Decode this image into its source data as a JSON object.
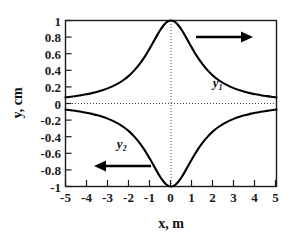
{
  "chart_data": {
    "type": "line",
    "title": "",
    "xlabel": "x,  m",
    "ylabel": "y,  cm",
    "xlim": [
      -5,
      5
    ],
    "ylim": [
      -1,
      1
    ],
    "grid": false,
    "legend_position": "inline-annotation",
    "xticks": [
      "-5",
      "-4",
      "-3",
      "-2",
      "-1",
      "0",
      "1",
      "2",
      "3",
      "4",
      "5"
    ],
    "xtick_values": [
      -5,
      -4,
      -3,
      -2,
      -1,
      0,
      1,
      2,
      3,
      4,
      5
    ],
    "yticks": [
      "1",
      "0.8",
      "0.6",
      "0.4",
      "0.2",
      "0",
      "-0.2",
      "-0.4",
      "-0.6",
      "-0.8",
      "-1"
    ],
    "ytick_values": [
      1,
      0.8,
      0.6,
      0.4,
      0.2,
      0,
      -0.2,
      -0.4,
      -0.6,
      -0.8,
      -1
    ],
    "zero_line_y": 0,
    "zero_line_x": 0,
    "x": [
      -5,
      -4.75,
      -4.5,
      -4.25,
      -4,
      -3.75,
      -3.5,
      -3.25,
      -3,
      -2.75,
      -2.5,
      -2.25,
      -2,
      -1.75,
      -1.5,
      -1.25,
      -1,
      -0.875,
      -0.75,
      -0.625,
      -0.5,
      -0.375,
      -0.25,
      -0.125,
      0,
      0.125,
      0.25,
      0.375,
      0.5,
      0.625,
      0.75,
      0.875,
      1,
      1.25,
      1.5,
      1.75,
      2,
      2.25,
      2.5,
      2.75,
      3,
      3.25,
      3.5,
      3.75,
      4,
      4.25,
      4.5,
      4.75,
      5
    ],
    "series": [
      {
        "name": "y1",
        "label": "y₁",
        "axis_arrow": "right",
        "values": [
          0.074,
          0.081,
          0.09,
          0.1,
          0.111,
          0.125,
          0.141,
          0.159,
          0.182,
          0.209,
          0.242,
          0.283,
          0.333,
          0.396,
          0.471,
          0.561,
          0.667,
          0.723,
          0.78,
          0.836,
          0.889,
          0.934,
          0.97,
          0.992,
          1.0,
          0.992,
          0.97,
          0.934,
          0.889,
          0.836,
          0.78,
          0.723,
          0.667,
          0.561,
          0.471,
          0.396,
          0.333,
          0.283,
          0.242,
          0.209,
          0.182,
          0.159,
          0.141,
          0.125,
          0.111,
          0.1,
          0.09,
          0.081,
          0.074
        ]
      },
      {
        "name": "y2",
        "label": "y₂",
        "axis_arrow": "left",
        "values": [
          -0.074,
          -0.081,
          -0.09,
          -0.1,
          -0.111,
          -0.125,
          -0.141,
          -0.159,
          -0.182,
          -0.209,
          -0.242,
          -0.283,
          -0.333,
          -0.396,
          -0.471,
          -0.561,
          -0.667,
          -0.723,
          -0.78,
          -0.836,
          -0.889,
          -0.934,
          -0.97,
          -0.992,
          -1.0,
          -0.992,
          -0.97,
          -0.934,
          -0.889,
          -0.836,
          -0.78,
          -0.723,
          -0.667,
          -0.561,
          -0.471,
          -0.396,
          -0.333,
          -0.283,
          -0.242,
          -0.209,
          -0.182,
          -0.159,
          -0.141,
          -0.125,
          -0.111,
          -0.1,
          -0.09,
          -0.081,
          -0.074
        ]
      }
    ],
    "annotations": [
      {
        "name": "y1-axis-arrow",
        "direction": "right",
        "x_range": [
          1.6,
          4.2
        ],
        "y": 0.82
      },
      {
        "name": "y2-axis-arrow",
        "direction": "left",
        "x_range": [
          -3.7,
          -1.2
        ],
        "y": -0.76
      },
      {
        "name": "y1-label",
        "text": "y₁",
        "x": 2.55,
        "y": 0.4
      },
      {
        "name": "y2-label",
        "text": "y₂",
        "x": -2.35,
        "y": -0.53
      }
    ]
  },
  "colors": {
    "curve": "#000000",
    "axis": "#1a1a1a",
    "zero_line": "#444444",
    "background": "#ffffff"
  }
}
